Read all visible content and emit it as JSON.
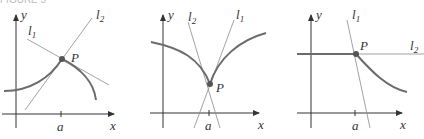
{
  "figure": {
    "header_text": "FIGURE 5",
    "panels": [
      {
        "id": "panel-1",
        "description": "Curve with a corner at P: two distinct one-sided tangent lines",
        "labels": {
          "y": "y",
          "x": "x",
          "a": "a",
          "P": "P",
          "l1": "l",
          "l1_sub": "1",
          "l2": "l",
          "l2_sub": "2"
        }
      },
      {
        "id": "panel-2",
        "description": "Cusp at P: tangent lines become steep from both sides",
        "labels": {
          "y": "y",
          "x": "x",
          "a": "a",
          "P": "P",
          "l1": "l",
          "l1_sub": "1",
          "l2": "l",
          "l2_sub": "2"
        }
      },
      {
        "id": "panel-3",
        "description": "Horizontal line meets decreasing curve at P: corner with horizontal and steep tangents",
        "labels": {
          "y": "y",
          "x": "x",
          "a": "a",
          "P": "P",
          "l1": "l",
          "l1_sub": "1",
          "l2": "l",
          "l2_sub": "2"
        }
      }
    ],
    "colors": {
      "curve": "#6b6b6b",
      "axis": "#333333",
      "tangent": "#8a8a8a",
      "point": "#555555"
    }
  }
}
